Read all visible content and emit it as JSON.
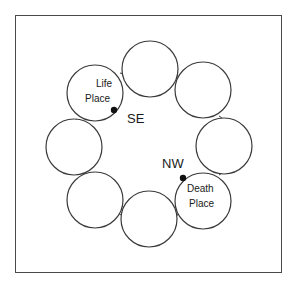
{
  "diagram": {
    "circle_count": 8,
    "colors": {
      "stroke": "#3a3a3a",
      "frame": "#4a4a4a",
      "dot": "#111111",
      "text": "#1a1a1a",
      "background": "#ffffff"
    },
    "circles": [
      {
        "id": "top",
        "cx": 150,
        "cy": 69
      },
      {
        "id": "upper-right",
        "cx": 203,
        "cy": 90
      },
      {
        "id": "right",
        "cx": 224,
        "cy": 146
      },
      {
        "id": "lower-right",
        "cx": 203,
        "cy": 201,
        "label_lines": [
          "Death",
          "Place"
        ]
      },
      {
        "id": "bottom",
        "cx": 149,
        "cy": 219
      },
      {
        "id": "lower-left",
        "cx": 95,
        "cy": 200
      },
      {
        "id": "left",
        "cx": 74,
        "cy": 147
      },
      {
        "id": "upper-left",
        "cx": 95,
        "cy": 93,
        "label_lines": [
          "Life",
          "Place"
        ]
      }
    ],
    "radius": 28,
    "life_place": {
      "line1": "Life",
      "line2": "Place",
      "marker_direction": "SE"
    },
    "death_place": {
      "line1": "Death",
      "line2": "Place",
      "marker_direction": "NW"
    },
    "direction_labels": {
      "se": "SE",
      "nw": "NW"
    }
  }
}
